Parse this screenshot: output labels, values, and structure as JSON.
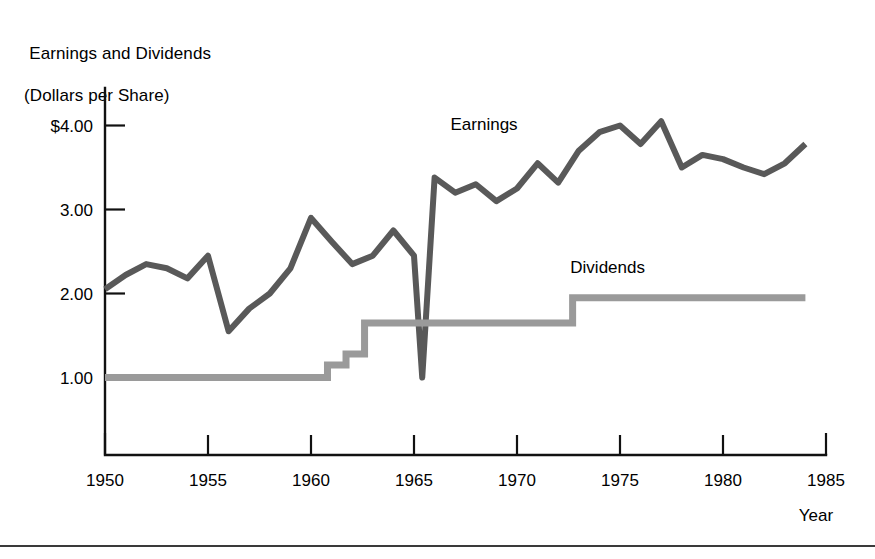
{
  "chart_data": {
    "type": "line",
    "title": "Earnings and Dividends",
    "subtitle": "(Dollars per Share)",
    "title_line1": "Earnings and Dividends",
    "title_line2": "(Dollars per Share)",
    "xlabel": "Year",
    "ylabel": "",
    "xlim": [
      1950,
      1985
    ],
    "ylim": [
      0,
      4.45
    ],
    "grid": false,
    "xticks": [
      1950,
      1955,
      1960,
      1965,
      1970,
      1975,
      1980,
      1985
    ],
    "xtick_labels": [
      "1950",
      "1955",
      "1960",
      "1965",
      "1970",
      "1975",
      "1980",
      "1985"
    ],
    "yticks": [
      1.0,
      2.0,
      3.0,
      4.0
    ],
    "ytick_labels": [
      "1.00",
      "2.00",
      "3.00",
      "$4.00"
    ],
    "legend_position": "inline-annotations",
    "series": [
      {
        "name": "Earnings",
        "color": "#595959",
        "label_text": "Earnings",
        "x": [
          1950,
          1951,
          1952,
          1953,
          1954,
          1955,
          1956,
          1957,
          1958,
          1959,
          1960,
          1961,
          1962,
          1963,
          1964,
          1965,
          1965.4,
          1966,
          1967,
          1968,
          1969,
          1970,
          1971,
          1972,
          1973,
          1974,
          1975,
          1976,
          1977,
          1978,
          1979,
          1980,
          1981,
          1982,
          1983,
          1984
        ],
        "values": [
          2.05,
          2.22,
          2.35,
          2.3,
          2.18,
          2.45,
          1.55,
          1.82,
          2.0,
          2.3,
          2.9,
          2.62,
          2.35,
          2.45,
          2.75,
          2.45,
          1.0,
          3.38,
          3.2,
          3.3,
          3.1,
          3.25,
          3.55,
          3.32,
          3.7,
          3.92,
          4.0,
          3.78,
          4.05,
          3.5,
          3.65,
          3.6,
          3.5,
          3.42,
          3.55,
          3.78
        ]
      },
      {
        "name": "Dividends",
        "color": "#9a9a9a",
        "label_text": "Dividends",
        "step": true,
        "x": [
          1950,
          1960.8,
          1960.8,
          1961.7,
          1961.7,
          1962.6,
          1962.6,
          1972.7,
          1972.7,
          1984
        ],
        "values": [
          1.0,
          1.0,
          1.15,
          1.15,
          1.28,
          1.28,
          1.65,
          1.65,
          1.95,
          1.95
        ]
      }
    ],
    "annotations": [
      {
        "text": "Earnings",
        "x": 1968.4,
        "y": 3.95
      },
      {
        "text": "Dividends",
        "x": 1974.4,
        "y": 2.25
      }
    ]
  }
}
